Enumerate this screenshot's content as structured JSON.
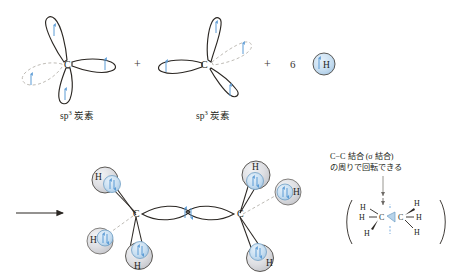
{
  "figure": {
    "type": "diagram",
    "topic": "sp3 carbon hybrid orbitals combining with hydrogen to form ethane",
    "background_color": "#ffffff",
    "ink_color": "#231f20",
    "electron_color": "#5b9bd5",
    "dashed_orbital_color": "#bfbcb6",
    "sphere_color": "#d9dade"
  },
  "reaction": {
    "carbon_left": {
      "atom_symbol": "C",
      "caption_prefix": "sp",
      "caption_superscript": "3",
      "caption_suffix": " 炭素",
      "caption_full": "sp3 炭素",
      "orbital_count": 4,
      "electron_count": 4
    },
    "plus_1": "+",
    "carbon_right": {
      "atom_symbol": "C",
      "caption_prefix": "sp",
      "caption_superscript": "3",
      "caption_suffix": " 炭素",
      "caption_full": "sp3 炭素",
      "orbital_count": 4,
      "electron_count": 4
    },
    "plus_2": "+",
    "hydrogen_term": {
      "coefficient": "6",
      "atom_symbol": "H"
    }
  },
  "product": {
    "arrow": "→",
    "molecule_name": "ethane",
    "left_carbon_symbol": "C",
    "right_carbon_symbol": "C",
    "hydrogens": [
      {
        "id": "h-upper-left",
        "symbol": "H"
      },
      {
        "id": "h-lower-left",
        "symbol": "H"
      },
      {
        "id": "h-bottom-left",
        "symbol": "H"
      },
      {
        "id": "h-upper-right",
        "symbol": "H"
      },
      {
        "id": "h-outer-right",
        "symbol": "H"
      },
      {
        "id": "h-bottom-right",
        "symbol": "H"
      }
    ],
    "sigma_bond_label": "σ"
  },
  "annotation": {
    "line1": "C−C 結合 (σ 結合)",
    "line2": "の周りで回転できる",
    "structure": {
      "open_paren": "(",
      "close_paren": ")",
      "left_carbon": "C",
      "right_carbon": "C",
      "h_labels": [
        "H",
        "H",
        "H",
        "H",
        "H",
        "H"
      ]
    }
  }
}
